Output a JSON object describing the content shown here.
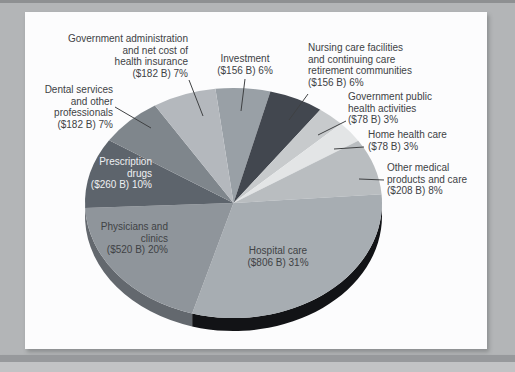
{
  "page": {
    "background_color": "#b3b5b7",
    "card_color": "#fcfcfd",
    "text_color": "#404245",
    "leader_line_color": "#3f4143"
  },
  "chart_data": {
    "type": "pie",
    "title": "",
    "style": "3d-pie",
    "start_angle_deg": -97,
    "total_billions": 2626,
    "slices": [
      {
        "name": "Investment",
        "value_billions": 156,
        "percent": 6,
        "label_lines": [
          "Investment",
          "($156 B) 6%"
        ],
        "color": "#99a0a6",
        "side_color": "#555b61"
      },
      {
        "name": "Nursing care facilities and continuing care retirement communities",
        "value_billions": 156,
        "percent": 6,
        "label_lines": [
          "Nursing care facilities",
          "and continuing care",
          "retirement communities",
          "($156 B) 6%"
        ],
        "color": "#42474f",
        "side_color": "#26292e"
      },
      {
        "name": "Government public health activities",
        "value_billions": 78,
        "percent": 3,
        "label_lines": [
          "Government public",
          "health activities",
          "($78 B) 3%"
        ],
        "color": "#c7cacc",
        "side_color": "#8f9294"
      },
      {
        "name": "Home health care",
        "value_billions": 78,
        "percent": 3,
        "label_lines": [
          "Home health care",
          "($78 B) 3%"
        ],
        "color": "#e3e5e6",
        "side_color": "#a6a8a9"
      },
      {
        "name": "Other medical products and care",
        "value_billions": 208,
        "percent": 8,
        "label_lines": [
          "Other medical",
          "products and care",
          "($208 B) 8%"
        ],
        "color": "#b9bdc0",
        "side_color": "#84888b"
      },
      {
        "name": "Hospital care",
        "value_billions": 806,
        "percent": 31,
        "label_lines": [
          "Hospital care",
          "($806 B) 31%"
        ],
        "color": "#a7adb2",
        "side_color": "#121316"
      },
      {
        "name": "Physicians and clinics",
        "value_billions": 520,
        "percent": 20,
        "label_lines": [
          "Physicians and",
          "clinics",
          "($520 B) 20%"
        ],
        "color": "#8f959b",
        "side_color": "#63686e"
      },
      {
        "name": "Prescription drugs",
        "value_billions": 260,
        "percent": 10,
        "label_lines": [
          "Prescription",
          "drugs",
          "($260 B) 10%"
        ],
        "color": "#5d646c",
        "side_color": "#3a3f45"
      },
      {
        "name": "Dental services and other professionals",
        "value_billions": 182,
        "percent": 7,
        "label_lines": [
          "Dental services",
          "and other",
          "professionals",
          "($182 B) 7%"
        ],
        "color": "#7f868c",
        "side_color": "#54595e"
      },
      {
        "name": "Government administration and net cost of health insurance",
        "value_billions": 182,
        "percent": 7,
        "label_lines": [
          "Government administration",
          "and net cost of",
          "health insurance",
          "($182 B) 7%"
        ],
        "color": "#b4b8bd",
        "side_color": "#81858a"
      }
    ]
  }
}
